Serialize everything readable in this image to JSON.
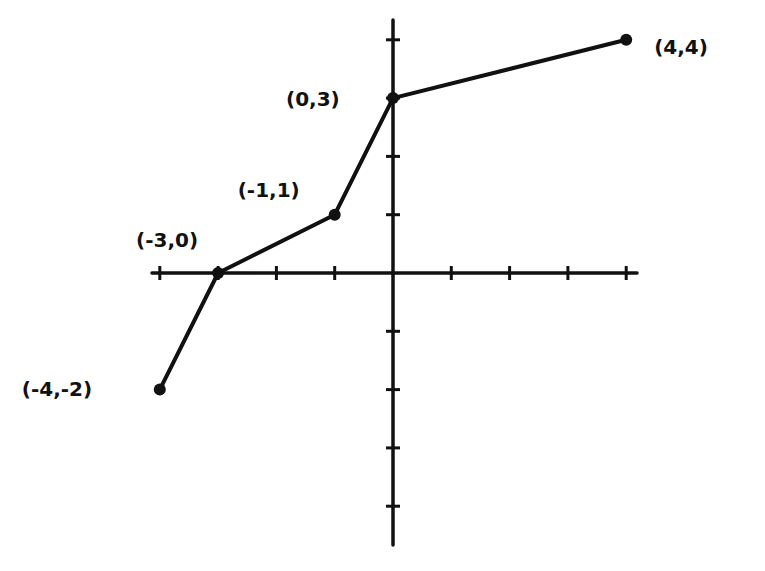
{
  "chart_data": {
    "type": "line",
    "title": "",
    "xlabel": "",
    "ylabel": "",
    "xlim": [
      -4,
      4
    ],
    "ylim": [
      -4.5,
      4.5
    ],
    "grid": false,
    "legend": null,
    "x_ticks": [
      -4,
      -3,
      -2,
      -1,
      0,
      1,
      2,
      3,
      4
    ],
    "y_ticks": [
      -4,
      -3,
      -2,
      -1,
      0,
      1,
      2,
      3,
      4
    ],
    "series": [
      {
        "name": "piecewise linear",
        "points": [
          {
            "x": -4,
            "y": -2,
            "label": "(-4,-2)"
          },
          {
            "x": -3,
            "y": 0,
            "label": "(-3,0)"
          },
          {
            "x": -1,
            "y": 1,
            "label": "(-1,1)"
          },
          {
            "x": 0,
            "y": 3,
            "label": "(0,3)"
          },
          {
            "x": 4,
            "y": 4,
            "label": "(4,4)"
          }
        ]
      }
    ],
    "style": {
      "ink": "#111111",
      "background": "#ffffff",
      "hand_drawn": true
    }
  }
}
